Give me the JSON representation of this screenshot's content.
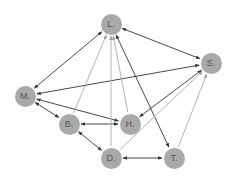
{
  "diagram": {
    "title": "",
    "colors": {
      "background": "#ffffff",
      "node_fill": "#a9a9a9",
      "node_text": "#555555",
      "edge_dark": "#333333",
      "edge_light": "#aaaaaa"
    },
    "nodes": [
      {
        "id": "L",
        "label": "L.",
        "x": 111,
        "y": 24
      },
      {
        "id": "S",
        "label": "S.",
        "x": 211,
        "y": 63
      },
      {
        "id": "M",
        "label": "M.",
        "x": 25,
        "y": 96
      },
      {
        "id": "B",
        "label": "B.",
        "x": 69,
        "y": 124
      },
      {
        "id": "H",
        "label": "H.",
        "x": 130,
        "y": 124
      },
      {
        "id": "D",
        "label": "D.",
        "x": 111,
        "y": 158
      },
      {
        "id": "T",
        "label": "T.",
        "x": 174,
        "y": 158
      }
    ],
    "edges": [
      {
        "from": "L",
        "to": "M",
        "direction": "both",
        "style": "dark"
      },
      {
        "from": "L",
        "to": "S",
        "direction": "both",
        "style": "dark"
      },
      {
        "from": "L",
        "to": "T",
        "direction": "both",
        "style": "dark"
      },
      {
        "from": "S",
        "to": "M",
        "direction": "both",
        "style": "dark"
      },
      {
        "from": "S",
        "to": "H",
        "direction": "both",
        "style": "dark"
      },
      {
        "from": "M",
        "to": "H",
        "direction": "both",
        "style": "dark"
      },
      {
        "from": "M",
        "to": "B",
        "direction": "both",
        "style": "dark"
      },
      {
        "from": "B",
        "to": "H",
        "direction": "both",
        "style": "dark"
      },
      {
        "from": "B",
        "to": "D",
        "direction": "both",
        "style": "dark"
      },
      {
        "from": "D",
        "to": "T",
        "direction": "both",
        "style": "dark"
      },
      {
        "from": "B",
        "to": "L",
        "direction": "forward",
        "style": "light"
      },
      {
        "from": "D",
        "to": "L",
        "direction": "forward",
        "style": "light"
      },
      {
        "from": "H",
        "to": "L",
        "direction": "forward",
        "style": "light"
      },
      {
        "from": "D",
        "to": "S",
        "direction": "forward",
        "style": "light"
      },
      {
        "from": "T",
        "to": "S",
        "direction": "forward",
        "style": "light"
      }
    ]
  },
  "labels": {
    "L": "L.",
    "S": "S.",
    "M": "M.",
    "B": "B.",
    "H": "H.",
    "D": "D.",
    "T": "T."
  }
}
